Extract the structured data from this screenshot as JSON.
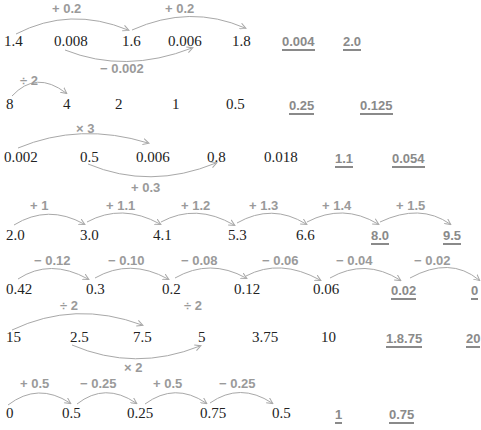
{
  "colors": {
    "number": "#222222",
    "answer": "#8a8a8a",
    "operator": "#9a9a9a",
    "arc": "#a8a8a8"
  },
  "rows": [
    {
      "numbers": [
        "1.4",
        "0.008",
        "1.6",
        "0.006",
        "1.8"
      ],
      "answers": [
        "0.004",
        "2.0"
      ],
      "operators": [
        "+ 0.2",
        "+ 0.2",
        "− 0.002"
      ]
    },
    {
      "numbers": [
        "8",
        "4",
        "2",
        "1",
        "0.5"
      ],
      "answers": [
        "0.25",
        "0.125"
      ],
      "operators": [
        "÷ 2"
      ]
    },
    {
      "numbers": [
        "0.002",
        "0.5",
        "0.006",
        "0.8",
        "0.018"
      ],
      "answers": [
        "1.1",
        "0.054"
      ],
      "operators": [
        "× 3",
        "+ 0.3"
      ]
    },
    {
      "numbers": [
        "2.0",
        "3.0",
        "4.1",
        "5.3",
        "6.6"
      ],
      "answers": [
        "8.0",
        "9.5"
      ],
      "operators": [
        "+ 1",
        "+ 1.1",
        "+ 1.2",
        "+ 1.3",
        "+ 1.4",
        "+ 1.5"
      ]
    },
    {
      "numbers": [
        "0.42",
        "0.3",
        "0.2",
        "0.12",
        "0.06"
      ],
      "answers": [
        "0.02",
        "0"
      ],
      "operators": [
        "− 0.12",
        "− 0.10",
        "− 0.08",
        "− 0.06",
        "− 0.04",
        "− 0.02"
      ]
    },
    {
      "numbers": [
        "15",
        "2.5",
        "7.5",
        "5",
        "3.75",
        "10"
      ],
      "answers": [
        "1.8.75",
        "20"
      ],
      "operators": [
        "÷ 2",
        "÷ 2",
        "× 2"
      ]
    },
    {
      "numbers": [
        "0",
        "0.5",
        "0.25",
        "0.75",
        "0.5"
      ],
      "answers": [
        "1",
        "0.75"
      ],
      "operators": [
        "+ 0.5",
        "− 0.25",
        "+ 0.5",
        "− 0.25"
      ]
    }
  ]
}
